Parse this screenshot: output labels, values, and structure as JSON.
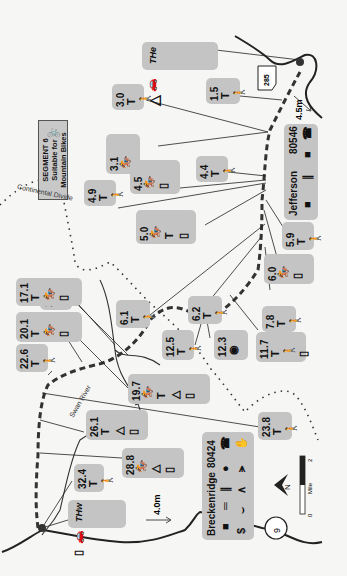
{
  "map": {
    "title": "SEGMENT 6",
    "subtitle_1": "Suitable for",
    "subtitle_2": "Mountain Bikes",
    "bike_icon": "bicycle-icon",
    "features": {
      "continental_divide": "Continental Divide",
      "swan_river": "Swan River",
      "highway_285": "285",
      "highway_9": "9",
      "distance_east": "4.5m",
      "distance_west": "4.0m"
    },
    "towns": [
      {
        "name": "Jefferson",
        "zip": "80546",
        "icons": [
          "post-office-icon",
          "food-icon",
          "grocery-icon",
          "phone-icon"
        ]
      },
      {
        "name": "Breckenridge",
        "zip": "80424",
        "icons": [
          "post-office-icon",
          "lodging-icon",
          "food-icon",
          "grocery-icon",
          "phone-icon",
          "atm-icon",
          "shower-icon",
          "camping-supplies-icon",
          "laundry-icon"
        ]
      }
    ],
    "trailheads": [
      {
        "label": "THe",
        "icons": [
          "car-icon",
          "campsite-icon",
          "water-icon"
        ]
      },
      {
        "label": "THw",
        "icons": [
          "car-icon",
          "water-icon"
        ]
      }
    ],
    "waypoints": [
      {
        "mile": "1.5",
        "icons": [
          "trail-sign-icon",
          "hiker-icon"
        ]
      },
      {
        "mile": "3.0",
        "icons": [
          "trail-sign-icon",
          "hiker-icon"
        ]
      },
      {
        "mile": "3.1",
        "icons": [
          "horse-hiker-icon",
          "water-icon"
        ]
      },
      {
        "mile": "4.4",
        "icons": [
          "trail-sign-icon",
          "hiker-icon"
        ]
      },
      {
        "mile": "4.5",
        "icons": [
          "horse-hiker-icon",
          "water-icon"
        ]
      },
      {
        "mile": "4.9",
        "icons": [
          "trail-sign-icon",
          "hiker-icon"
        ]
      },
      {
        "mile": "5.0",
        "icons": [
          "horse-hiker-icon",
          "trail-sign-icon",
          "water-icon"
        ]
      },
      {
        "mile": "5.9",
        "icons": [
          "trail-sign-icon",
          "hiker-icon"
        ]
      },
      {
        "mile": "6.0",
        "icons": [
          "horse-hiker-icon",
          "water-icon"
        ]
      },
      {
        "mile": "6.1",
        "icons": [
          "trail-sign-icon",
          "hiker-icon"
        ]
      },
      {
        "mile": "6.2",
        "icons": [
          "trail-sign-icon",
          "hiker-icon"
        ]
      },
      {
        "mile": "7.8",
        "icons": [
          "trail-sign-icon",
          "hiker-icon"
        ]
      },
      {
        "mile": "11.7",
        "icons": [
          "trail-sign-icon",
          "hiker-icon",
          "water-icon"
        ]
      },
      {
        "mile": "12.3",
        "icons": [
          "camera-icon"
        ]
      },
      {
        "mile": "12.5",
        "icons": [
          "trail-sign-icon",
          "hiker-icon"
        ]
      },
      {
        "mile": "15.4",
        "icons": [
          "trail-sign-icon",
          "hiker-icon"
        ]
      },
      {
        "mile": "17.1",
        "icons": [
          "trail-sign-icon",
          "horse-hiker-icon",
          "water-icon"
        ]
      },
      {
        "mile": "19.7",
        "icons": [
          "horse-hiker-icon",
          "trail-sign-icon",
          "campsite-icon",
          "water-icon"
        ]
      },
      {
        "mile": "20.1",
        "icons": [
          "trail-sign-icon",
          "horse-hiker-icon",
          "water-icon"
        ]
      },
      {
        "mile": "22.6",
        "icons": [
          "trail-sign-icon",
          "hiker-icon"
        ]
      },
      {
        "mile": "23.8",
        "icons": [
          "trail-sign-icon",
          "hiker-icon"
        ]
      },
      {
        "mile": "26.1",
        "icons": [
          "trail-sign-icon",
          "campsite-icon",
          "water-icon"
        ]
      },
      {
        "mile": "28.8",
        "icons": [
          "horse-hiker-icon",
          "campsite-icon",
          "water-icon"
        ]
      },
      {
        "mile": "32.4",
        "icons": [
          "trail-sign-icon",
          "hiker-icon"
        ]
      }
    ],
    "scale": {
      "start": "0",
      "end": "2",
      "unit": "Mile"
    },
    "north_label": "N"
  }
}
